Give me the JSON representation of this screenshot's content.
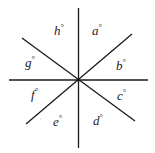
{
  "diagram": {
    "line_color": "#1a1a1a",
    "label_color": "#222222",
    "degree_symbol": "°",
    "lines": [
      {
        "name": "vertical-line"
      },
      {
        "name": "horizontal-line"
      },
      {
        "name": "diagonal-line-descending"
      },
      {
        "name": "diagonal-line-ascending"
      }
    ],
    "angles": [
      {
        "id": "a",
        "label": "a",
        "position": "top-right"
      },
      {
        "id": "b",
        "label": "b",
        "position": "right-upper"
      },
      {
        "id": "c",
        "label": "c",
        "position": "right-lower"
      },
      {
        "id": "d",
        "label": "d",
        "position": "bottom-right"
      },
      {
        "id": "e",
        "label": "e",
        "position": "bottom-left"
      },
      {
        "id": "f",
        "label": "f",
        "position": "left-lower"
      },
      {
        "id": "g",
        "label": "g",
        "position": "left-upper"
      },
      {
        "id": "h",
        "label": "h",
        "position": "top-left"
      }
    ]
  }
}
